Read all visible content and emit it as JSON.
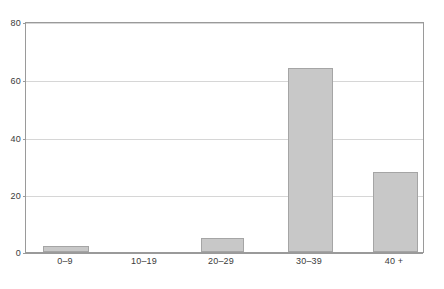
{
  "chart_data": {
    "type": "bar",
    "title": "",
    "subtitle": "",
    "xlabel": "",
    "ylabel": "",
    "categories": [
      "0–9",
      "10–19",
      "20–29",
      "30–39",
      "40 +"
    ],
    "values": [
      2,
      0,
      5,
      64,
      28
    ],
    "ylim": [
      0,
      80
    ],
    "yticks": [
      0,
      20,
      40,
      60,
      80
    ],
    "ytick_labels": [
      "0",
      "20",
      "40",
      "60",
      "80"
    ],
    "grid": true,
    "grid_axis": "y",
    "legend": false,
    "legend_position": "none",
    "annotations": [],
    "colors": {
      "bar_fill": "#c8c8c8",
      "bar_border": "#a5a5a5",
      "gridline": "#d6d6d6",
      "axis": "#9a9a9a",
      "tick_text": "#3a3a3a",
      "background": "#ffffff"
    }
  }
}
